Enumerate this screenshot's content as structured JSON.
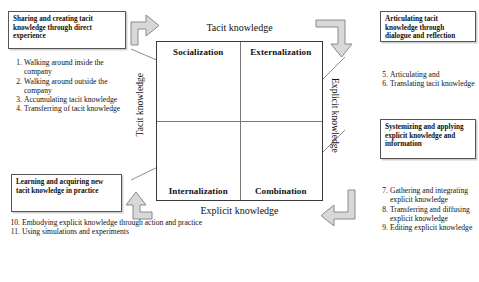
{
  "diagram": {
    "axes": {
      "top": "Tacit knowledge",
      "bottom": "Explicit knowledge",
      "left": "Tacit knowledge",
      "right": "Explicit knowledge"
    },
    "quadrants": [
      {
        "id": "socialization",
        "label": "Socialization",
        "position": "top-left",
        "art": "two-overlapping-circles",
        "nodes": [
          "i",
          "i"
        ]
      },
      {
        "id": "externalization",
        "label": "Externalization",
        "position": "top-right",
        "art": "group-of-individuals-around-group",
        "nodes": [
          "i",
          "i",
          "i",
          "i",
          "i",
          "i",
          "i",
          "G"
        ]
      },
      {
        "id": "internalization",
        "label": "Internalization",
        "position": "bottom-left",
        "art": "nested-circles",
        "nodes": [
          "o",
          "G",
          "i"
        ]
      },
      {
        "id": "combination",
        "label": "Combination",
        "position": "bottom-right",
        "art": "groups-within-organization",
        "nodes": [
          "G",
          "G",
          "G",
          "G",
          "o"
        ]
      }
    ],
    "spiral": {
      "name": "knowledge-spiral",
      "color": "#000000"
    },
    "flow_arrows": [
      {
        "id": "arrow-top-left",
        "direction": "up-then-right"
      },
      {
        "id": "arrow-top-right",
        "direction": "left-then-down"
      },
      {
        "id": "arrow-bottom-right",
        "direction": "down-then-left"
      },
      {
        "id": "arrow-bottom-left",
        "direction": "right-then-up"
      }
    ]
  },
  "callouts": {
    "top_left": "Sharing and creating tacit knowledge through direct experience",
    "bottom_left": "Learning and acquiring  new tacit knowledge in practice",
    "top_right": "Articulating  tacit knowledge through dialogue and reflection",
    "mid_right": "Systemizing and applying  explicit knowledge and information"
  },
  "lists": {
    "top_left": [
      {
        "num": "1.",
        "text": "Walking around inside the company"
      },
      {
        "num": "2.",
        "text": "Walking around outside the company"
      },
      {
        "num": "3.",
        "text": "Accumulating tacit knowledge"
      },
      {
        "num": "4.",
        "text": "Transferring of tacit knowledge"
      }
    ],
    "bottom_left": [
      {
        "num": "10.",
        "text": "Embodying explicit knowledge through action and practice"
      },
      {
        "num": "11.",
        "text": "Using simulations and experiments"
      }
    ],
    "top_right": [
      {
        "num": "5.",
        "text": "Articulating and"
      },
      {
        "num": "6.",
        "text": "Translating tacit knowledge"
      }
    ],
    "bottom_right": [
      {
        "num": "7.",
        "text": "Gathering and integrating explicit knowledge"
      },
      {
        "num": "8.",
        "text": "Transferring and diffusing explicit knowledge"
      },
      {
        "num": "9.",
        "text": "Editing explicit knowledge"
      }
    ]
  },
  "colors": {
    "border": "#555555",
    "arrow_fill": "#d8d8d8",
    "arrow_stroke": "#8a8a8a",
    "circle_stroke": "#8d8d8d",
    "text": "#111111"
  }
}
